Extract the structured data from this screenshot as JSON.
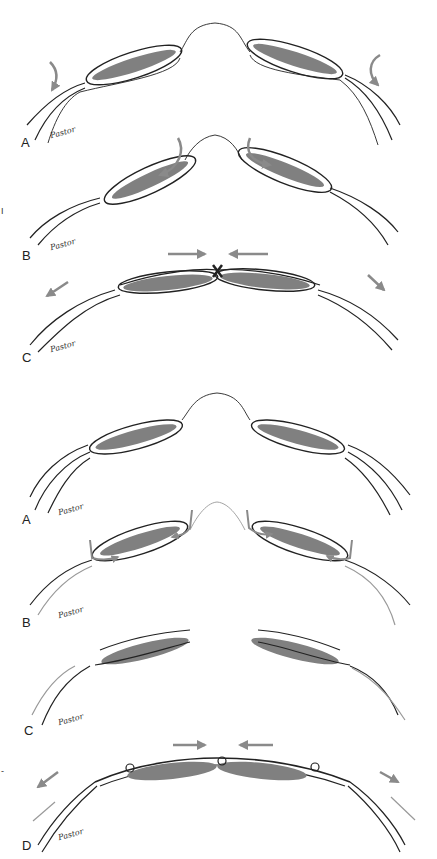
{
  "figure": {
    "panels_top": [
      {
        "label": "A",
        "signature": "Pastor"
      },
      {
        "label": "B",
        "signature": "Pastor"
      },
      {
        "label": "C",
        "signature": "Pastor"
      }
    ],
    "panels_bottom": [
      {
        "label": "A",
        "signature": "Pastor"
      },
      {
        "label": "B",
        "signature": "Pastor"
      },
      {
        "label": "C",
        "signature": "Pastor"
      },
      {
        "label": "D",
        "signature": "Pastor"
      }
    ],
    "side_marks": [
      "I",
      "-"
    ],
    "colors": {
      "line": "#222222",
      "fill": "#808080",
      "arrow": "#8a8a8a"
    }
  }
}
